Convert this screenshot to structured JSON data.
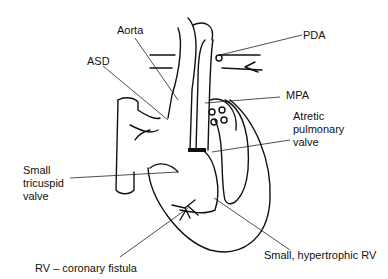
{
  "diagram": {
    "labels": [
      {
        "id": "aorta",
        "text": "Aorta"
      },
      {
        "id": "asd",
        "text": "ASD"
      },
      {
        "id": "pda",
        "text": "PDA"
      },
      {
        "id": "mpa",
        "text": "MPA"
      },
      {
        "id": "atretic_pulmonary_valve",
        "text": "Atretic\npulmonary\nvalve"
      },
      {
        "id": "small_tricuspid_valve",
        "text": "Small\ntricuspid\nvalve"
      },
      {
        "id": "rv_coronary_fistula",
        "text": "RV – coronary fistula"
      },
      {
        "id": "small_hypertrophic_rv",
        "text": "Small, hypertrophic RV"
      }
    ],
    "colors": {
      "line": "#111111",
      "background": "#ffffff"
    }
  }
}
